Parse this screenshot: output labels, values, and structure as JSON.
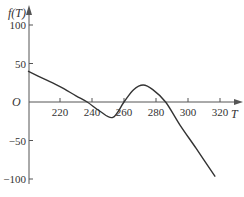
{
  "chart_data": {
    "type": "line",
    "title": "",
    "xlabel": "T",
    "ylabel": "f(T)",
    "origin_label": "O",
    "x_ticks": [
      220,
      240,
      260,
      280,
      300,
      320
    ],
    "y_ticks": [
      100,
      50,
      -50,
      -100
    ],
    "xlim": [
      200,
      325
    ],
    "ylim": [
      -105,
      115
    ],
    "grid": false,
    "legend": null,
    "series": [
      {
        "name": "f(T)",
        "x": [
          200,
          210,
          220,
          230,
          237,
          245,
          253,
          260,
          266,
          272,
          278,
          286,
          295,
          305,
          317
        ],
        "values": [
          40,
          30,
          20,
          8,
          0,
          -12,
          -20,
          0,
          16,
          22,
          16,
          0,
          -30,
          -60,
          -97
        ]
      }
    ],
    "colors": {
      "line": "#333333",
      "axis": "#555555"
    }
  }
}
